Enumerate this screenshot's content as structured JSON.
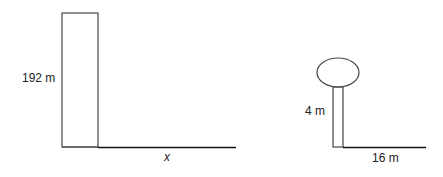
{
  "diagram": {
    "building": {
      "height_label": "192 m",
      "shadow_label": "x"
    },
    "tree": {
      "height_label": "4 m",
      "shadow_label": "16 m"
    }
  },
  "colors": {
    "line": "#333333",
    "ground": "#111111",
    "background": "#ffffff"
  }
}
